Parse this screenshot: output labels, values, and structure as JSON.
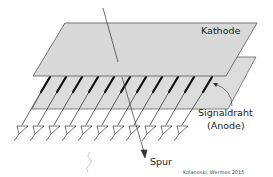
{
  "diagram": {
    "labels": {
      "cathode": "Kathode",
      "signal_wire": "Signaldraht",
      "anode": "(Anode)",
      "track": "Spur",
      "credit": "Kolanoski, Wermes 2015"
    },
    "colors": {
      "plane_fill": "#d9d9d9",
      "plane_stroke": "#555555",
      "wire": "#111111",
      "track": "#333333",
      "squiggle": "#bbbbbb"
    },
    "wire_count": 11
  }
}
